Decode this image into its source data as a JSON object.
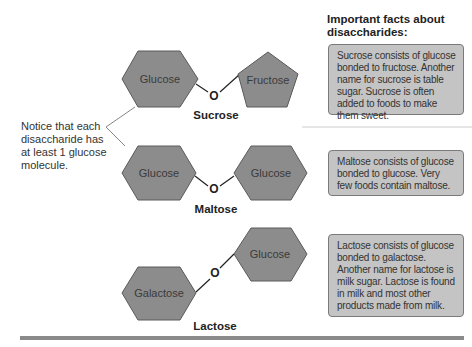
{
  "facts_title": "Important facts about disaccharides:",
  "notice_text": "Notice that each disaccharide has at least 1 glucose molecule.",
  "bond_atom": "O",
  "disaccharides": [
    {
      "name": "Sucrose",
      "left_unit": "Glucose",
      "right_unit": "Fructose",
      "fact": "Sucrose consists of glucose bonded to fructose. Another name for sucrose is table sugar. Sucrose is often added to foods to make them sweet."
    },
    {
      "name": "Maltose",
      "left_unit": "Glucose",
      "right_unit": "Glucose",
      "fact": "Maltose consists of glucose bonded to glucose. Very few foods contain maltose."
    },
    {
      "name": "Lactose",
      "left_unit": "Galactose",
      "right_unit": "Glucose",
      "fact": "Lactose consists of glucose bonded to galactose. Another name for lactose is milk sugar. Lactose is found in milk and most other products made from milk."
    }
  ],
  "colors": {
    "shape_fill": "#8c8c8c",
    "shape_stroke": "#5a5a5a",
    "fact_box_fill": "#c4c4c4",
    "rule": "#8a8a8a"
  }
}
